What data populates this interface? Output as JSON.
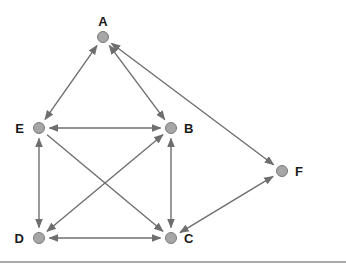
{
  "diagram": {
    "type": "directed-graph",
    "nodes": [
      {
        "id": "A",
        "label": "A",
        "x": 103,
        "y": 37,
        "label_pos": "above"
      },
      {
        "id": "E",
        "label": "E",
        "x": 39,
        "y": 128,
        "label_pos": "left"
      },
      {
        "id": "B",
        "label": "B",
        "x": 171,
        "y": 128,
        "label_pos": "right"
      },
      {
        "id": "F",
        "label": "F",
        "x": 282,
        "y": 171,
        "label_pos": "right"
      },
      {
        "id": "D",
        "label": "D",
        "x": 39,
        "y": 238,
        "label_pos": "left"
      },
      {
        "id": "C",
        "label": "C",
        "x": 171,
        "y": 238,
        "label_pos": "right"
      }
    ],
    "edges": [
      {
        "from": "A",
        "to": "E",
        "bidirectional": true
      },
      {
        "from": "A",
        "to": "B",
        "bidirectional": true
      },
      {
        "from": "A",
        "to": "F",
        "bidirectional": true
      },
      {
        "from": "E",
        "to": "B",
        "bidirectional": true
      },
      {
        "from": "E",
        "to": "D",
        "bidirectional": true
      },
      {
        "from": "E",
        "to": "C",
        "bidirectional": false
      },
      {
        "from": "D",
        "to": "B",
        "bidirectional": true
      },
      {
        "from": "B",
        "to": "C",
        "bidirectional": true
      },
      {
        "from": "D",
        "to": "C",
        "bidirectional": true
      },
      {
        "from": "F",
        "to": "C",
        "bidirectional": true
      }
    ],
    "colors": {
      "node_fill": "#a6a6a6",
      "edge": "#6e6e6e",
      "label": "#1a1a1a",
      "rule": "#a9a9a9"
    }
  }
}
